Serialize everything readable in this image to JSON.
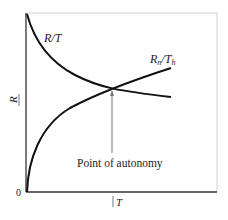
{
  "diagram": {
    "curves": [
      {
        "id": "r-over-t",
        "label_main": "R",
        "label_sep": "/",
        "label_den": "T",
        "shape": "decreasing"
      },
      {
        "id": "rn-over-th",
        "label_main": "R",
        "label_main_sub": "n",
        "label_sep": "/",
        "label_den": "T",
        "label_den_sub": "h",
        "shape": "increasing"
      }
    ],
    "annotation": "Point of autonomy",
    "axes": {
      "y_label": "R",
      "x_label": "T",
      "origin_label": "0"
    },
    "colors": {
      "curve": "#111111",
      "axis": "#333333",
      "frame": "#cccccc",
      "arrow": "#777777"
    }
  }
}
